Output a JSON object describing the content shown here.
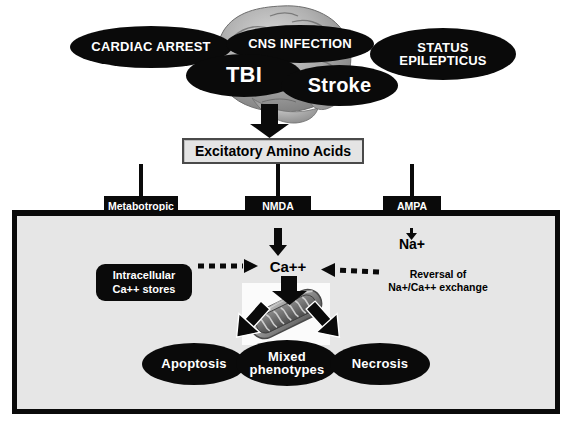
{
  "figure": {
    "type": "biomedical-pathway-diagram",
    "title_text": "Excitatory Amino Acids"
  },
  "insults": [
    {
      "id": "cardiac-arrest",
      "label": "CARDIAC ARREST"
    },
    {
      "id": "cns-infection",
      "label": "CNS INFECTION"
    },
    {
      "id": "status-epilepticus",
      "label": "STATUS\nEPILEPTICUS"
    },
    {
      "id": "tbi",
      "label": "TBI"
    },
    {
      "id": "stroke",
      "label": "Stroke"
    }
  ],
  "insult_labels": {
    "cardiac_arrest": "CARDIAC ARREST",
    "cns_infection": "CNS INFECTION",
    "status_line1": "STATUS",
    "status_line2": "EPILEPTICUS",
    "tbi": "TBI",
    "stroke": "Stroke"
  },
  "mediator": {
    "label": "Excitatory Amino Acids"
  },
  "receptors": [
    {
      "id": "metabotropic",
      "line1": "Metabotropic",
      "line2": "Receptor"
    },
    {
      "id": "nmda",
      "line1": "NMDA",
      "line2": "Receptor"
    },
    {
      "id": "ampa",
      "line1": "AMPA",
      "line2": "Receptor"
    }
  ],
  "receptor_labels": {
    "metabotropic_l1": "Metabotropic",
    "metabotropic_l2": "Receptor",
    "nmda_l1": "NMDA",
    "nmda_l2": "Receptor",
    "ampa_l1": "AMPA",
    "ampa_l2": "Receptor"
  },
  "intracellular": {
    "store_line1": "Intracellular",
    "store_line2": "Ca++ stores",
    "calcium_label": "Ca++",
    "sodium_label": "Na+",
    "exchange_line1": "Reversal of",
    "exchange_line2": "Na+/Ca++ exchange"
  },
  "organelle": {
    "name": "mitochondrion"
  },
  "outcomes": [
    {
      "id": "apoptosis",
      "label": "Apoptosis"
    },
    {
      "id": "mixed",
      "line1": "Mixed",
      "line2": "phenotypes"
    },
    {
      "id": "necrosis",
      "label": "Necrosis"
    }
  ],
  "outcome_labels": {
    "apoptosis": "Apoptosis",
    "mixed_l1": "Mixed",
    "mixed_l2": "phenotypes",
    "necrosis": "Necrosis"
  },
  "colors": {
    "ellipse_fill": "#0a0a0a",
    "ellipse_text": "#ffffff",
    "cell_fill": "#e6e6e6",
    "cell_border": "#0a0a0a",
    "eaa_fill": "#e4e4e4",
    "eaa_border": "#4a4a4a",
    "page_background": "#ffffff"
  }
}
